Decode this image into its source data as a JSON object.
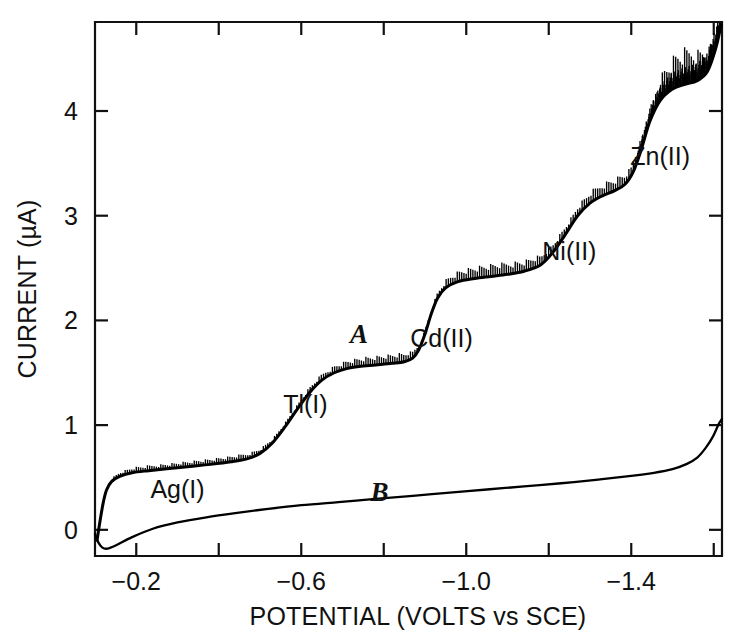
{
  "figure": {
    "name": "dc-polarogram",
    "background_color": "#ffffff",
    "ink_color": "#000000"
  },
  "chart_data": {
    "type": "line",
    "title": "",
    "subtitle": "",
    "xlabel": "POTENTIAL (VOLTS vs SCE)",
    "ylabel": "CURRENT (µA)",
    "xlim": [
      -0.1,
      -1.62
    ],
    "ylim": [
      -0.25,
      4.85
    ],
    "x_major_ticks": [
      -0.2,
      -0.6,
      -1.0,
      -1.4
    ],
    "x_major_tick_labels": [
      "−0.2",
      "−0.6",
      "−1.0",
      "−1.4"
    ],
    "x_minor_ticks": [
      -0.4,
      -0.8,
      -1.2,
      -1.6
    ],
    "y_major_ticks": [
      0,
      1,
      2,
      3,
      4
    ],
    "y_major_tick_labels": [
      "0",
      "1",
      "2",
      "3",
      "4"
    ],
    "grid": false,
    "legend": "none",
    "frame": "box-with-ticks",
    "annotations": [
      {
        "text": "Ag(I)",
        "x": -0.3,
        "y": 0.3,
        "style": "upright"
      },
      {
        "text": "Tl(I)",
        "x": -0.61,
        "y": 1.12,
        "style": "upright"
      },
      {
        "text": "A",
        "x": -0.74,
        "y": 1.78,
        "style": "italic"
      },
      {
        "text": "Cd(II)",
        "x": -0.94,
        "y": 1.75,
        "style": "upright"
      },
      {
        "text": "B",
        "x": -0.79,
        "y": 0.28,
        "style": "italic"
      },
      {
        "text": "Ni(II)",
        "x": -1.25,
        "y": 2.58,
        "style": "upright"
      },
      {
        "text": "Zn(II)",
        "x": -1.47,
        "y": 3.48,
        "style": "upright"
      }
    ],
    "series": [
      {
        "name": "A",
        "description": "Sample polarogram with Ag(I), Tl(I), Cd(II), Ni(II), Zn(II) waves",
        "oscillating": true,
        "x": [
          -0.105,
          -0.112,
          -0.12,
          -0.128,
          -0.14,
          -0.16,
          -0.19,
          -0.23,
          -0.28,
          -0.33,
          -0.38,
          -0.43,
          -0.47,
          -0.5,
          -0.53,
          -0.56,
          -0.59,
          -0.62,
          -0.65,
          -0.68,
          -0.71,
          -0.74,
          -0.78,
          -0.82,
          -0.85,
          -0.87,
          -0.885,
          -0.9,
          -0.915,
          -0.93,
          -0.95,
          -0.98,
          -1.02,
          -1.06,
          -1.1,
          -1.14,
          -1.18,
          -1.21,
          -1.24,
          -1.27,
          -1.3,
          -1.33,
          -1.36,
          -1.385,
          -1.405,
          -1.425,
          -1.445,
          -1.47,
          -1.5,
          -1.53,
          -1.56,
          -1.585,
          -1.605,
          -1.618
        ],
        "y": [
          -0.1,
          0.08,
          0.26,
          0.38,
          0.46,
          0.51,
          0.545,
          0.565,
          0.585,
          0.605,
          0.625,
          0.65,
          0.68,
          0.73,
          0.83,
          0.98,
          1.15,
          1.31,
          1.43,
          1.5,
          1.54,
          1.56,
          1.575,
          1.59,
          1.605,
          1.64,
          1.72,
          1.87,
          2.06,
          2.21,
          2.31,
          2.37,
          2.4,
          2.42,
          2.44,
          2.47,
          2.53,
          2.65,
          2.82,
          3.0,
          3.12,
          3.19,
          3.24,
          3.3,
          3.42,
          3.64,
          3.9,
          4.1,
          4.21,
          4.255,
          4.29,
          4.38,
          4.6,
          4.83
        ]
      },
      {
        "name": "B",
        "description": "Supporting-electrolyte residual current (blank)",
        "oscillating": false,
        "x": [
          -0.1,
          -0.108,
          -0.118,
          -0.13,
          -0.15,
          -0.19,
          -0.24,
          -0.3,
          -0.37,
          -0.44,
          -0.52,
          -0.6,
          -0.69,
          -0.78,
          -0.87,
          -0.96,
          -1.05,
          -1.14,
          -1.23,
          -1.32,
          -1.4,
          -1.455,
          -1.5,
          -1.535,
          -1.56,
          -1.58,
          -1.598,
          -1.612,
          -1.62
        ],
        "y": [
          -0.04,
          -0.12,
          -0.17,
          -0.18,
          -0.15,
          -0.07,
          0.01,
          0.07,
          0.12,
          0.16,
          0.2,
          0.235,
          0.265,
          0.295,
          0.325,
          0.355,
          0.385,
          0.415,
          0.445,
          0.48,
          0.515,
          0.545,
          0.58,
          0.63,
          0.69,
          0.78,
          0.89,
          1.01,
          1.06
        ]
      }
    ]
  }
}
